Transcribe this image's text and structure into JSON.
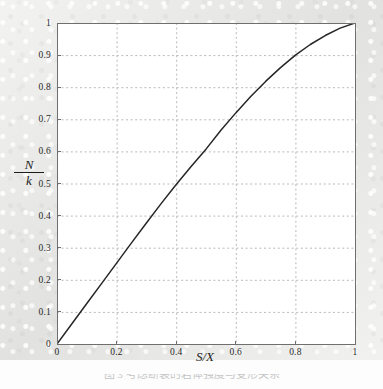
{
  "figure": {
    "background_color": "#e6e6e4",
    "panel_color": "#ffffff",
    "axis_color": "#6f6f6f",
    "grid_color": "#b9b9b9",
    "curve_color": "#262626",
    "caption": "图 3  考虑断裂的岩体强度与变形关系"
  },
  "chart_data": {
    "type": "line",
    "title": "",
    "subtitle": "",
    "xlabel": "S/X",
    "ylabel": "N/k",
    "xlim": [
      0,
      1
    ],
    "ylim": [
      0,
      1
    ],
    "grid": true,
    "legend": "none",
    "x_ticks": [
      "0",
      "0.2",
      "0.4",
      "0.6",
      "0.8",
      "1"
    ],
    "x_tick_values": [
      0,
      0.2,
      0.4,
      0.6,
      0.8,
      1
    ],
    "y_ticks": [
      "0",
      "0.1",
      "0.2",
      "0.3",
      "0.4",
      "0.5",
      "0.6",
      "0.7",
      "0.8",
      "0.9",
      "1"
    ],
    "y_tick_values": [
      0,
      0.1,
      0.2,
      0.3,
      0.4,
      0.5,
      0.6,
      0.7,
      0.8,
      0.9,
      1
    ],
    "series": [
      {
        "name": "N/k vs S/X",
        "x": [
          0,
          0.05,
          0.1,
          0.15,
          0.2,
          0.25,
          0.3,
          0.35,
          0.4,
          0.45,
          0.5,
          0.55,
          0.6,
          0.65,
          0.7,
          0.75,
          0.8,
          0.85,
          0.9,
          0.95,
          1.0
        ],
        "values": [
          0,
          0.063,
          0.126,
          0.189,
          0.252,
          0.315,
          0.377,
          0.438,
          0.497,
          0.553,
          0.607,
          0.666,
          0.72,
          0.771,
          0.818,
          0.861,
          0.9,
          0.933,
          0.961,
          0.984,
          1.0
        ]
      }
    ]
  }
}
